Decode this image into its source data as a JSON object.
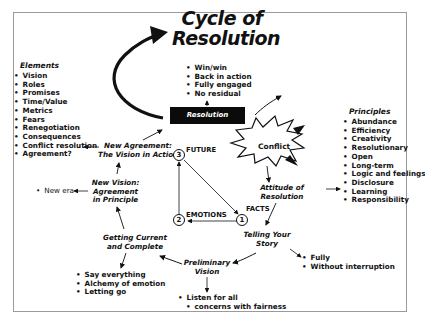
{
  "title": {
    "line1": "Cycle of",
    "line2": "Resolution"
  },
  "resolution": {
    "label": "Resolution",
    "outcomes": [
      "Win/win",
      "Back in action",
      "Fully engaged",
      "No residual"
    ]
  },
  "elements": {
    "heading": "Elements",
    "items": [
      "Vision",
      "Roles",
      "Promises",
      "Time/Value",
      "Metrics",
      "Fears",
      "Renegotiation",
      "Consequences",
      "Conflict resolution",
      "Agreement?"
    ]
  },
  "principles": {
    "heading": "Principles",
    "items": [
      "Abundance",
      "Efficiency",
      "Creativity",
      "Resolutionary",
      "Open",
      "Long-term",
      "Logic and feelings",
      "Disclosure",
      "Learning",
      "Responsibility"
    ]
  },
  "cycle_stages": {
    "conflict": "Conflict",
    "attitude": {
      "line1": "Attitude of",
      "line2": "Resolution"
    },
    "telling": {
      "line1": "Telling Your",
      "line2": "Story"
    },
    "preliminary": {
      "line1": "Preliminary",
      "line2": "Vision"
    },
    "getting_current": {
      "line1": "Getting Current",
      "line2": "and Complete"
    },
    "new_vision": {
      "line1": "New Vision:",
      "line2": "Agreement",
      "line3": "in Principle"
    },
    "new_agreement": {
      "line1": "New Agreement:",
      "line2": "The Vision in Action"
    }
  },
  "annotations": {
    "telling": [
      "Fully",
      "Without interruption"
    ],
    "preliminary": [
      "Listen for all",
      "concerns with fairness"
    ],
    "getting_current": [
      "Say everything",
      "Alchemy of emotion",
      "Letting go"
    ],
    "new_vision": [
      "New era"
    ]
  },
  "triangle": {
    "nodes": [
      {
        "number": "1",
        "label": "FACTS"
      },
      {
        "number": "2",
        "label": "EMOTIONS"
      },
      {
        "number": "3",
        "label": "FUTURE"
      }
    ]
  },
  "colors": {
    "ink": "#111111",
    "resolution_box": "#0b0b0b",
    "frame": "#9a9a9a",
    "background": "#ffffff"
  }
}
